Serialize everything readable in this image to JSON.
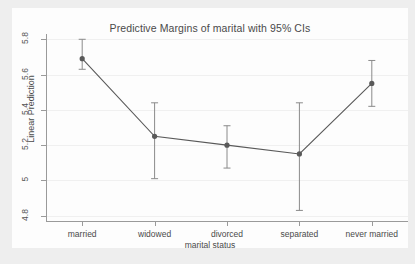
{
  "chart_data": {
    "type": "line",
    "title": "Predictive Margins of marital with 95% CIs",
    "xlabel": "marital status",
    "ylabel": "Linear Prediction",
    "categories": [
      "married",
      "widowed",
      "divorced",
      "separated",
      "never married"
    ],
    "values": [
      5.69,
      5.25,
      5.2,
      5.15,
      5.55
    ],
    "ci_lower": [
      5.63,
      5.01,
      5.07,
      4.83,
      5.42
    ],
    "ci_upper": [
      5.8,
      5.44,
      5.31,
      5.44,
      5.68
    ],
    "ylim": [
      4.77,
      5.83
    ],
    "yticks": [
      4.8,
      5,
      5.2,
      5.4,
      5.6,
      5.8
    ],
    "ytick_labels": [
      "4.8",
      "5",
      "5.2",
      "5.4",
      "5.6",
      "5.8"
    ],
    "grid": true,
    "legend": "none",
    "marker": "filled-circle",
    "series_color": "#595959",
    "ci_color": "#8a8a8a",
    "gridline_color": "#f0f0f0",
    "axis_color": "#9a9a9a",
    "plot_background": "#fdfdfd",
    "page_background": "#eeeeee",
    "note_clipped_right": "never married label and its upper CI extend past the right image edge"
  }
}
